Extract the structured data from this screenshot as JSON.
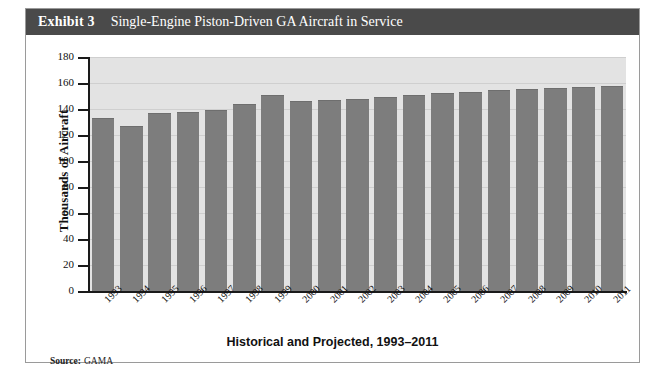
{
  "exhibit": {
    "number_label": "Exhibit 3",
    "title": "Single-Engine Piston-Driven GA Aircraft in Service",
    "header_bg": "#4a4a4a",
    "header_text_color": "#ffffff",
    "frame_border": "#9a9a9a"
  },
  "source": {
    "label": "Source:",
    "value": "GAMA"
  },
  "chart_data": {
    "type": "bar",
    "title": "Single-Engine Piston-Driven GA Aircraft in Service",
    "subtitle": "",
    "xlabel": "Historical and Projected, 1993–2011",
    "ylabel": "Thousands of Aircraft",
    "categories": [
      "1993",
      "1994",
      "1995",
      "1996",
      "1997",
      "1998",
      "1999",
      "2000",
      "2001",
      "2002",
      "2003",
      "2004",
      "2005",
      "2006",
      "2007",
      "2008",
      "2009",
      "2010",
      "2011"
    ],
    "values": [
      133,
      127,
      137,
      137.5,
      139.5,
      144,
      151,
      146,
      147,
      148,
      149,
      150.5,
      152,
      153,
      154.5,
      155.5,
      156,
      157,
      158
    ],
    "ylim": [
      0,
      180
    ],
    "yticks": [
      0,
      20,
      40,
      60,
      80,
      100,
      120,
      140,
      160,
      180
    ],
    "ytick_labels": [
      "0",
      "20",
      "40",
      "60",
      "80",
      "100",
      "120",
      "140",
      "160",
      "180"
    ],
    "grid": true,
    "legend": "none",
    "bar_color": "#7d7d7d",
    "plot_bg": "#e3e3e3",
    "axis_color": "#1a1a1a",
    "xtick_rotation": -45
  }
}
